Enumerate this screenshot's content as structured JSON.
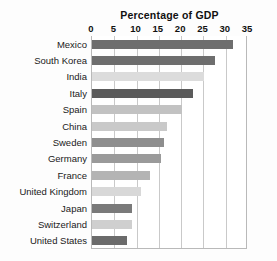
{
  "chart_data": {
    "type": "bar",
    "orientation": "horizontal",
    "title": "Percentage of GDP",
    "xlabel": "",
    "ylabel": "",
    "xlim": [
      0,
      35
    ],
    "xticks": [
      0,
      5,
      10,
      15,
      20,
      25,
      30,
      35
    ],
    "xtick_labels": [
      "0",
      "5",
      "10",
      "15",
      "20",
      "25",
      "30",
      "35"
    ],
    "grid": true,
    "grid_axis": "x",
    "legend": false,
    "categories": [
      "Mexico",
      "South Korea",
      "India",
      "Italy",
      "Spain",
      "China",
      "Sweden",
      "Germany",
      "France",
      "United Kingdom",
      "Japan",
      "Switzerland",
      "United States"
    ],
    "values": [
      31.6,
      27.5,
      25.2,
      22.6,
      20.3,
      16.8,
      16.1,
      15.4,
      13.1,
      10.9,
      8.9,
      8.9,
      7.8
    ],
    "bar_colors": [
      "#6e6e6e",
      "#6e6e6e",
      "#dcdcdc",
      "#5b5b5b",
      "#c2c2c2",
      "#c9c9c9",
      "#8e8e8e",
      "#9a9a9a",
      "#b4b4b4",
      "#d8d8d8",
      "#7a7a7a",
      "#cfcfcf",
      "#6b6b6b"
    ]
  },
  "colors": {
    "background": "#fdfdfd",
    "plot_background": "#ffffff",
    "gridline": "#c9c9c9",
    "axis": "#b9b9b9",
    "text": "#1a1a1a",
    "title_text": "#111111"
  }
}
